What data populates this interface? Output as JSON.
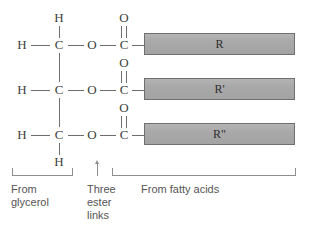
{
  "diagram": {
    "backbone": {
      "rows": [
        {
          "id": "row-1",
          "carbon": "C",
          "hydrogen_left": "H",
          "hydrogen_top": "H",
          "ester_oxygen": "O",
          "carbonyl_carbon": "C",
          "carbonyl_oxygen": "O",
          "chain_label": "R"
        },
        {
          "id": "row-2",
          "carbon": "C",
          "hydrogen_left": "H",
          "ester_oxygen": "O",
          "carbonyl_carbon": "C",
          "carbonyl_oxygen": "O",
          "chain_label": "R'"
        },
        {
          "id": "row-3",
          "carbon": "C",
          "hydrogen_left": "H",
          "hydrogen_bottom": "H",
          "ester_oxygen": "O",
          "carbonyl_carbon": "C",
          "carbonyl_oxygen": "O",
          "chain_label": "R\""
        }
      ]
    },
    "annotations": {
      "glycerol": "From\nglycerol",
      "ester": "Three\nester\nlinks",
      "fatty_acids": "From fatty acids"
    },
    "colors": {
      "background": "#ffffff",
      "bond": "#6e6e6e",
      "atom_text": "#3f3f3f",
      "chain_fill": "#a9a9a9",
      "chain_border": "#6f6f6f",
      "caption_text": "#555555",
      "bracket": "#8d8d8d"
    }
  }
}
